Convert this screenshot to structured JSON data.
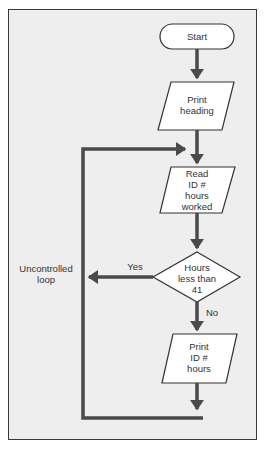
{
  "diagram": {
    "type": "flowchart",
    "colors": {
      "background": "#eeeeee",
      "shape_fill": "#ffffff",
      "line": "#4a4a4a",
      "frame": "#3a3a3a",
      "text": "#333333"
    },
    "nodes": [
      {
        "id": "start",
        "shape": "terminator",
        "label": "Start"
      },
      {
        "id": "print_heading",
        "shape": "parallelogram",
        "label": "Print heading"
      },
      {
        "id": "read",
        "shape": "parallelogram",
        "label": "Read ID # hours worked"
      },
      {
        "id": "decision",
        "shape": "diamond",
        "label": "Hours less than 41"
      },
      {
        "id": "print_id",
        "shape": "parallelogram",
        "label": "Print ID # hours"
      }
    ],
    "edges": [
      {
        "from": "start",
        "to": "print_heading",
        "label": ""
      },
      {
        "from": "print_heading",
        "to": "read",
        "label": ""
      },
      {
        "from": "read",
        "to": "decision",
        "label": ""
      },
      {
        "from": "decision",
        "to": "print_id",
        "label": "No"
      },
      {
        "from": "decision",
        "to": "loop",
        "label": "Yes"
      },
      {
        "from": "print_id",
        "to": "read",
        "label": ""
      }
    ],
    "labels": {
      "start": "Start",
      "print_heading_1": "Print",
      "print_heading_2": "heading",
      "read_1": "Read",
      "read_2": "ID #",
      "read_3": "hours",
      "read_4": "worked",
      "decision_1": "Hours",
      "decision_2": "less than",
      "decision_3": "41",
      "print_id_1": "Print",
      "print_id_2": "ID #",
      "print_id_3": "hours",
      "yes": "Yes",
      "no": "No",
      "loop_1": "Uncontrolled",
      "loop_2": "loop"
    }
  }
}
